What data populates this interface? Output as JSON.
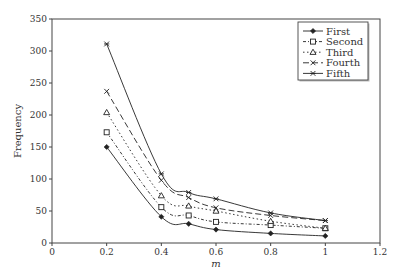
{
  "chart_data": {
    "type": "line",
    "title": "",
    "xlabel": "m",
    "ylabel": "Frequency",
    "xlim": [
      0,
      1.2
    ],
    "ylim": [
      0,
      350
    ],
    "xticks": [
      0,
      0.2,
      0.4,
      0.6,
      0.8,
      1,
      1.2
    ],
    "xtick_labels": [
      "0",
      "0.2",
      "0.4",
      "0.6",
      "0.8",
      "1",
      "1.2"
    ],
    "yticks": [
      0,
      50,
      100,
      150,
      200,
      250,
      300,
      350
    ],
    "ytick_labels": [
      "0",
      "50",
      "100",
      "150",
      "200",
      "250",
      "300",
      "350"
    ],
    "grid": false,
    "legend_position": "upper right",
    "x": [
      0.2,
      0.4,
      0.5,
      0.6,
      0.8,
      1.0
    ],
    "series": [
      {
        "name": "First",
        "values": [
          150,
          41,
          30,
          21,
          15,
          11
        ],
        "marker": "diamond",
        "dash": "solid"
      },
      {
        "name": "Second",
        "values": [
          173,
          56,
          43,
          33,
          28,
          23
        ],
        "marker": "square",
        "dash": "dash-dot"
      },
      {
        "name": "Third",
        "values": [
          204,
          74,
          58,
          50,
          34,
          23
        ],
        "marker": "triangle",
        "dash": "dot-dash"
      },
      {
        "name": "Fourth",
        "values": [
          237,
          98,
          71,
          55,
          43,
          35
        ],
        "marker": "x",
        "dash": "long-dash"
      },
      {
        "name": "Fifth",
        "values": [
          311,
          108,
          79,
          69,
          47,
          35
        ],
        "marker": "star",
        "dash": "solid"
      }
    ]
  },
  "colors": {
    "line": "#222222",
    "axis": "#444444",
    "text": "#333333",
    "background": "#ffffff"
  }
}
